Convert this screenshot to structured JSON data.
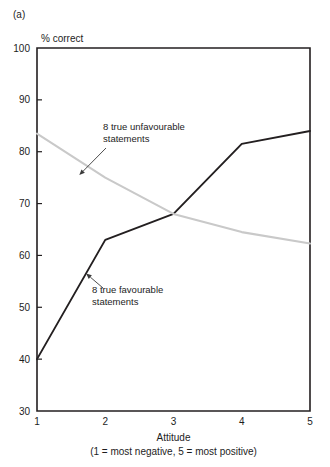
{
  "panel": {
    "label": "(a)"
  },
  "chart_data": {
    "type": "line",
    "title": "",
    "subtitle": "",
    "xlabel": "Attitude",
    "xlabel_note": "(1 = most negative, 5 = most positive)",
    "ylabel": "% correct",
    "x": [
      1,
      2,
      3,
      4,
      5
    ],
    "xticklabels": [
      "1",
      "2",
      "3",
      "4",
      "5"
    ],
    "yticks": [
      30,
      40,
      50,
      60,
      70,
      80,
      90,
      100
    ],
    "yticklabels": [
      "30",
      "40",
      "50",
      "60",
      "70",
      "80",
      "90",
      "100"
    ],
    "xlim": [
      1,
      5
    ],
    "ylim": [
      30,
      100
    ],
    "grid": false,
    "legend": "none",
    "series": [
      {
        "name": "8 true favourable statements",
        "color": "#231f20",
        "values": [
          40,
          63,
          68,
          81.5,
          84
        ]
      },
      {
        "name": "8 true unfavourable statements",
        "color": "#c9c9c9",
        "values": [
          83.5,
          75,
          68,
          64.5,
          62.3
        ]
      }
    ],
    "annotations": [
      {
        "text_line1": "8 true unfavourable",
        "text_line2": "statements",
        "target_x": 1.62,
        "target_y": 75.5
      },
      {
        "text_line1": "8 true favourable",
        "text_line2": "statements",
        "target_x": 1.72,
        "target_y": 56.5
      }
    ]
  }
}
